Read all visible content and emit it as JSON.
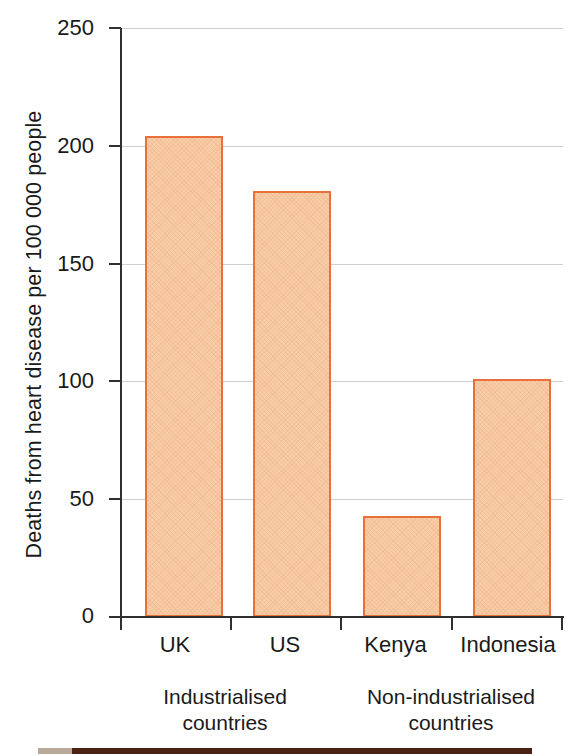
{
  "chart_data": {
    "type": "bar",
    "title": "",
    "xlabel": "",
    "ylabel": "Deaths from heart disease per 100 000 people",
    "categories": [
      "UK",
      "US",
      "Kenya",
      "Indonesia"
    ],
    "values": [
      204,
      181,
      43,
      101
    ],
    "groups": [
      {
        "label_line1": "Industrialised",
        "label_line2": "countries",
        "categories": [
          "UK",
          "US"
        ]
      },
      {
        "label_line1": "Non-industrialised",
        "label_line2": "countries",
        "categories": [
          "Kenya",
          "Indonesia"
        ]
      }
    ],
    "ylim": [
      0,
      250
    ],
    "ytick_labels": [
      "0",
      "50",
      "100",
      "150",
      "200",
      "250"
    ],
    "ytick_values": [
      0,
      50,
      100,
      150,
      200,
      250
    ],
    "grid": true,
    "legend": "none",
    "colors": {
      "bar_fill": "#f7cca7",
      "bar_border": "#e8703a",
      "axis": "#303030",
      "gridline": "#cfcfcf",
      "text": "#1a1a1a",
      "strip": "#4a2216"
    }
  }
}
